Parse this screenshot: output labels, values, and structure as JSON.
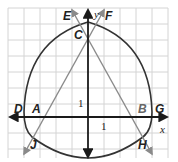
{
  "diagram": {
    "type": "coordinate-plane-geometric-construction",
    "axes": {
      "x_label": "x",
      "y_label": "y",
      "x_unit_label": "1",
      "y_unit_label": "1"
    },
    "points": {
      "A": "A",
      "B": "B",
      "C": "C",
      "D": "D",
      "E": "E",
      "F": "F",
      "G": "G",
      "H": "H",
      "J": "J"
    },
    "colors": {
      "grid": "#d4d4d4",
      "axis": "#1a1a1a",
      "curve": "#333333",
      "line": "#8a8a8a"
    }
  }
}
